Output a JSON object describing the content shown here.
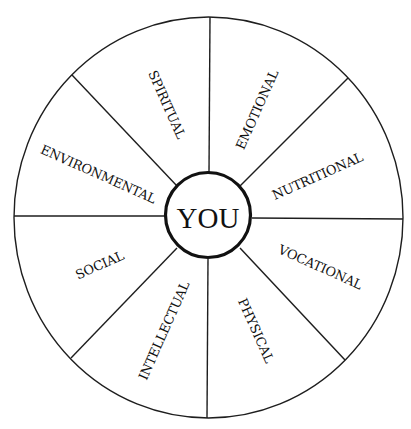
{
  "diagram": {
    "type": "wellness-wheel",
    "center_label": "YOU",
    "segments": [
      {
        "label": "SPIRITUAL",
        "x": 166,
        "y": 105,
        "angle": 66
      },
      {
        "label": "EMOTIONAL",
        "x": 258,
        "y": 110,
        "angle": -66
      },
      {
        "label": "NUTRITIONAL",
        "x": 318,
        "y": 177,
        "angle": -24
      },
      {
        "label": "VOCATIONAL",
        "x": 320,
        "y": 268,
        "angle": 24
      },
      {
        "label": "PHYSICAL",
        "x": 255,
        "y": 331,
        "angle": 66
      },
      {
        "label": "INTELLECTUAL",
        "x": 165,
        "y": 331,
        "angle": -66
      },
      {
        "label": "SOCIAL",
        "x": 100,
        "y": 266,
        "angle": -24
      },
      {
        "label": "ENVIRONMENTAL",
        "x": 98,
        "y": 175,
        "angle": 24
      }
    ],
    "colors": {
      "line": "#1e1e1e",
      "text": "#111111",
      "background": "#ffffff"
    }
  }
}
